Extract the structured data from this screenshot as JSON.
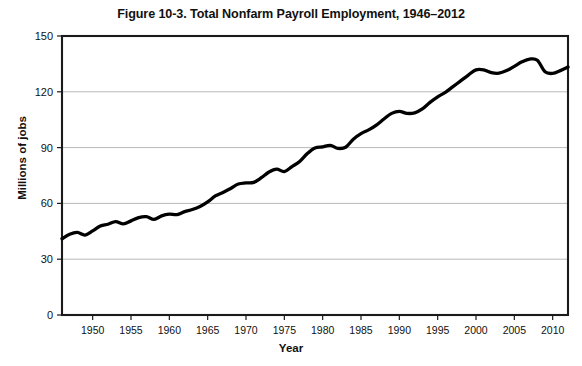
{
  "chart_data": {
    "type": "line",
    "title": "Figure 10-3. Total Nonfarm Payroll Employment, 1946–2012",
    "xlabel": "Year",
    "ylabel": "Millions of jobs",
    "xlim": [
      1946,
      2012
    ],
    "ylim": [
      0,
      150
    ],
    "grid": true,
    "legend": null,
    "ytick_labels": [
      "0",
      "30",
      "60",
      "90",
      "120",
      "150"
    ],
    "ytick_values": [
      0,
      30,
      60,
      90,
      120,
      150
    ],
    "xtick_labels": [
      "1950",
      "1955",
      "1960",
      "1965",
      "1970",
      "1975",
      "1980",
      "1985",
      "1990",
      "1995",
      "2000",
      "2005",
      "2010"
    ],
    "xtick_values": [
      1950,
      1955,
      1960,
      1965,
      1970,
      1975,
      1980,
      1985,
      1990,
      1995,
      2000,
      2005,
      2010
    ],
    "line_color": "#000000",
    "series": [
      {
        "name": "Total nonfarm payroll employment",
        "x": [
          1946,
          1947,
          1948,
          1949,
          1950,
          1951,
          1952,
          1953,
          1954,
          1955,
          1956,
          1957,
          1958,
          1959,
          1960,
          1961,
          1962,
          1963,
          1964,
          1965,
          1966,
          1967,
          1968,
          1969,
          1970,
          1971,
          1972,
          1973,
          1974,
          1975,
          1976,
          1977,
          1978,
          1979,
          1980,
          1981,
          1982,
          1983,
          1984,
          1985,
          1986,
          1987,
          1988,
          1989,
          1990,
          1991,
          1992,
          1993,
          1994,
          1995,
          1996,
          1997,
          1998,
          1999,
          2000,
          2001,
          2002,
          2003,
          2004,
          2005,
          2006,
          2007,
          2008,
          2009,
          2010,
          2011,
          2012
        ],
        "values": [
          41.0,
          43.4,
          44.4,
          43.0,
          45.2,
          47.8,
          48.8,
          50.2,
          49.0,
          50.6,
          52.4,
          52.9,
          51.4,
          53.3,
          54.2,
          54.0,
          55.6,
          56.7,
          58.3,
          60.8,
          64.0,
          65.9,
          68.0,
          70.4,
          71.0,
          71.3,
          73.8,
          76.9,
          78.4,
          77.1,
          79.8,
          82.5,
          86.8,
          89.8,
          90.4,
          91.2,
          89.6,
          90.2,
          94.5,
          97.5,
          99.5,
          102.1,
          105.4,
          108.4,
          109.5,
          108.4,
          108.7,
          110.8,
          114.3,
          117.3,
          119.7,
          122.8,
          125.9,
          129.0,
          131.8,
          131.8,
          130.3,
          130.0,
          131.4,
          133.7,
          136.1,
          137.6,
          137.0,
          130.8,
          129.9,
          131.4,
          133.3
        ]
      }
    ]
  },
  "figure": {
    "background": "#ffffff",
    "title": "Figure 10-3. Total Nonfarm Payroll Employment, 1946–2012",
    "x_axis_title": "Year",
    "y_axis_title": "Millions of jobs"
  }
}
